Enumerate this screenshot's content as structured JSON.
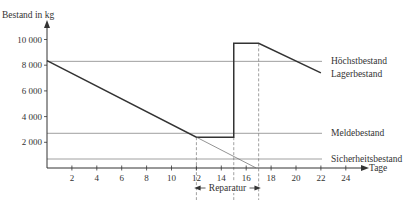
{
  "chart_data": {
    "type": "line",
    "title": "",
    "xlabel": "Tage",
    "ylabel": "Bestand in kg",
    "xlim": [
      0,
      25
    ],
    "ylim": [
      0,
      10600
    ],
    "x_ticks": [
      2,
      4,
      6,
      8,
      10,
      12,
      14,
      16,
      18,
      20,
      22,
      24
    ],
    "x_tick_labels": [
      "2",
      "4",
      "6",
      "8",
      "10",
      "12",
      "14",
      "16",
      "18",
      "20",
      "22",
      "24"
    ],
    "y_ticks": [
      2000,
      4000,
      6000,
      8000,
      10000
    ],
    "y_tick_labels": [
      "2 000",
      "4 000",
      "6 000",
      "8 000",
      "10 000"
    ],
    "grid": false,
    "series": [
      {
        "name": "Lagerbestand",
        "x": [
          0,
          12,
          15,
          15,
          17,
          22
        ],
        "y": [
          8350,
          2400,
          2400,
          9700,
          9700,
          7400
        ]
      },
      {
        "name": "Verbrauch ohne Reparatur",
        "style": "thin",
        "x": [
          12,
          16.8
        ],
        "y": [
          2400,
          0
        ]
      }
    ],
    "reference_lines": [
      {
        "name": "Höchstbestand",
        "y": 8300
      },
      {
        "name": "Meldebestand",
        "y": 2700
      },
      {
        "name": "Sicherheitsbestand",
        "y": 700
      }
    ],
    "vertical_markers": [
      12,
      15,
      17
    ],
    "annotations": [
      {
        "text": "Reparatur",
        "x_from": 12,
        "x_to": 17
      }
    ],
    "series_label": "Lagerbestand"
  }
}
